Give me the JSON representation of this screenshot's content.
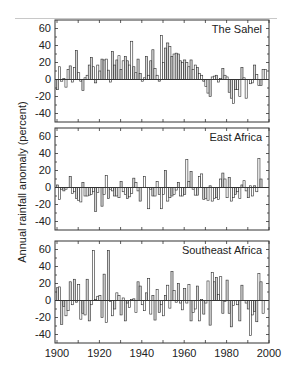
{
  "figure": {
    "ylabel": "Annual rainfall anomaly (percent)",
    "panels": [
      {
        "title": "The Sahel"
      },
      {
        "title": "East Africa"
      },
      {
        "title": "Southeast Africa"
      }
    ],
    "x_tick_labels": [
      "1900",
      "1920",
      "1940",
      "1960",
      "1980",
      "2000"
    ],
    "y_tick_labels": [
      "60",
      "40",
      "20",
      "0",
      "-20",
      "-40"
    ]
  },
  "colors": {
    "bar_fill": "#d4d4d4",
    "bar_stroke": "#2a2a2a",
    "axis": "#333333",
    "text": "#222222"
  },
  "chart_data": {
    "type": "bar",
    "title": "",
    "xlabel": "",
    "ylabel": "Annual rainfall anomaly (percent)",
    "xlim": [
      1900,
      2000
    ],
    "ylim": [
      -50,
      70
    ],
    "yticks": [
      60,
      40,
      20,
      0,
      -20,
      -40
    ],
    "xticks": [
      1900,
      1920,
      1940,
      1960,
      1980,
      2000
    ],
    "grid": false,
    "legend": "none",
    "x_start_year": 1900,
    "panels": [
      {
        "name": "The Sahel",
        "values": [
          -12,
          15,
          -2,
          1,
          -9,
          12,
          16,
          -3,
          14,
          34,
          8,
          -2,
          -13,
          2,
          5,
          17,
          26,
          15,
          -4,
          17,
          10,
          24,
          23,
          24,
          11,
          -3,
          33,
          17,
          23,
          28,
          12,
          22,
          27,
          22,
          17,
          45,
          15,
          8,
          24,
          7,
          -2,
          2,
          27,
          5,
          22,
          35,
          13,
          5,
          -2,
          52,
          20,
          37,
          43,
          39,
          27,
          30,
          31,
          30,
          22,
          20,
          23,
          20,
          15,
          23,
          12,
          17,
          14,
          7,
          5,
          -2,
          -8,
          -16,
          -20,
          3,
          4,
          5,
          -3,
          1,
          13,
          5,
          3,
          -15,
          -22,
          -28,
          -12,
          -12,
          -20,
          14,
          2,
          -22,
          0,
          -5,
          -4,
          17,
          6,
          -7,
          -7,
          12,
          12,
          0
        ]
      },
      {
        "name": "East Africa",
        "values": [
          3,
          -14,
          -2,
          -4,
          -2,
          0,
          13,
          -7,
          -5,
          -13,
          -15,
          -17,
          6,
          -10,
          -10,
          -9,
          -8,
          -5,
          -28,
          -6,
          0,
          -22,
          -8,
          14,
          -13,
          -2,
          -4,
          -10,
          -10,
          -12,
          7,
          -5,
          -8,
          -13,
          -11,
          -7,
          11,
          6,
          -4,
          -16,
          0,
          13,
          0,
          -25,
          -2,
          -10,
          -10,
          7,
          -8,
          -25,
          -8,
          20,
          -16,
          -12,
          -10,
          -8,
          -3,
          6,
          -10,
          -10,
          -8,
          33,
          7,
          19,
          -2,
          -9,
          -9,
          13,
          16,
          -14,
          -13,
          -15,
          2,
          -16,
          -13,
          -12,
          -14,
          10,
          17,
          10,
          -12,
          12,
          -16,
          -12,
          -8,
          -5,
          -13,
          3,
          8,
          -4,
          -12,
          2,
          -10,
          2,
          -5,
          34,
          10,
          0,
          0,
          0
        ]
      },
      {
        "name": "Southeast Africa",
        "values": [
          15,
          16,
          -28,
          -7,
          -18,
          -12,
          22,
          -5,
          25,
          -2,
          19,
          -22,
          -15,
          -17,
          25,
          -24,
          -5,
          59,
          1,
          5,
          6,
          -20,
          31,
          -26,
          59,
          -1,
          -18,
          -10,
          9,
          6,
          -17,
          3,
          -24,
          -3,
          -8,
          1,
          2,
          -14,
          22,
          17,
          -5,
          -12,
          9,
          26,
          -16,
          6,
          -23,
          13,
          -14,
          -5,
          -18,
          6,
          18,
          -9,
          34,
          12,
          -2,
          20,
          -3,
          -11,
          14,
          -3,
          19,
          -24,
          -14,
          -10,
          17,
          -24,
          1,
          -16,
          -3,
          23,
          -29,
          33,
          22,
          27,
          7,
          28,
          -15,
          -1,
          24,
          -15,
          -31,
          -6,
          0,
          -5,
          -24,
          18,
          0,
          -3,
          -10,
          -41,
          -17,
          -13,
          -25,
          32,
          22,
          -15,
          0,
          0
        ]
      }
    ]
  }
}
